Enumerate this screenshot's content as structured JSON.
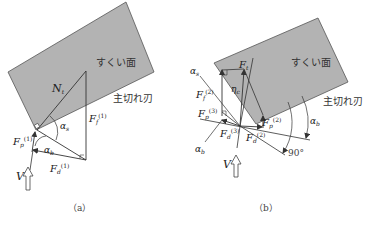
{
  "colors": {
    "face_fill": "#b3b3b3",
    "face_stroke": "#444444",
    "line": "#333333",
    "background": "#ffffff"
  },
  "panel_a": {
    "caption": "（a）",
    "rake_face_label": "すくい面",
    "cutting_edge_label": "主切れ刃",
    "labels": {
      "N": "N",
      "N_sub": "t",
      "Ff": "F",
      "Ff_sub": "f",
      "Ff_sup": "(1)",
      "Fp": "F",
      "Fp_sub": "p",
      "Fp_sup": "(1)",
      "Fd": "F",
      "Fd_sub": "d",
      "Fd_sup": "(1)",
      "alpha_s": "α",
      "alpha_s_sub": "s",
      "alpha_b": "α",
      "alpha_b_sub": "b",
      "V": "V"
    }
  },
  "panel_b": {
    "caption": "（b）",
    "rake_face_label": "すくい面",
    "cutting_edge_label": "主切れ刃",
    "labels": {
      "Ft": "F",
      "Ft_sub": "t",
      "eta": "η",
      "eta_sub": "c",
      "Ff": "F",
      "Ff_sub": "f",
      "Ff_sup": "(2)",
      "Fp3": "F",
      "Fp3_sub": "p",
      "Fp3_sup": "(3)",
      "Fd3": "F",
      "Fd3_sub": "d",
      "Fd3_sup": "(3)",
      "Fp2": "F",
      "Fp2_sub": "p",
      "Fp2_sup": "(2)",
      "Fd2": "F",
      "Fd2_sub": "d",
      "Fd2_sup": "(2)",
      "alpha_s": "α",
      "alpha_s_sub": "s",
      "alpha_b_left": "α",
      "alpha_b_left_sub": "b",
      "alpha_b_right": "α",
      "alpha_b_right_sub": "b",
      "angle_90": "90°",
      "V": "V"
    }
  }
}
